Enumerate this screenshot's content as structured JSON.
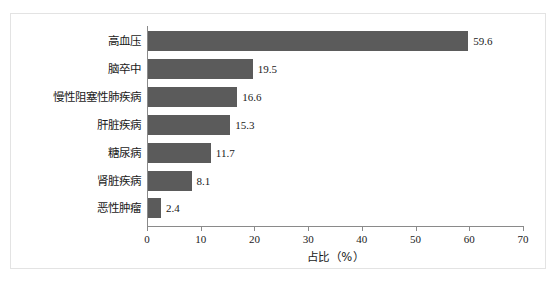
{
  "chart_data": {
    "type": "bar",
    "orientation": "horizontal",
    "title": "",
    "xlabel": "占比（%）",
    "ylabel": "",
    "xlim": [
      0,
      70
    ],
    "grid": false,
    "legend": null,
    "bar_color": "#5b5b5b",
    "axis_color": "#8a8a8a",
    "frame_color": "#e3e3e3",
    "background": "#ffffff",
    "xticks": [
      "0",
      "10",
      "20",
      "30",
      "40",
      "50",
      "60",
      "70"
    ],
    "xtick_values": [
      0,
      10,
      20,
      30,
      40,
      50,
      60,
      70
    ],
    "categories": [
      "高血压",
      "脑卒中",
      "慢性阻塞性肺疾病",
      "肝脏疾病",
      "糖尿病",
      "肾脏疾病",
      "恶性肿瘤"
    ],
    "values": [
      59.6,
      19.5,
      16.6,
      15.3,
      11.7,
      8.1,
      2.4
    ],
    "value_labels": [
      "59.6",
      "19.5",
      "16.6",
      "15.3",
      "11.7",
      "8.1",
      "2.4"
    ]
  }
}
